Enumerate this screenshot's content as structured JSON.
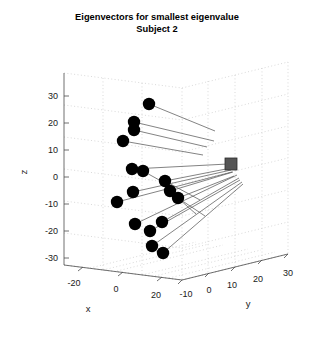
{
  "title": {
    "line1": "Eigenvectors for smallest eigenvalue",
    "line2": "Subject 2"
  },
  "axes": {
    "x": {
      "label": "x",
      "ticks": [
        "-20",
        "0",
        "20"
      ],
      "values": [
        -20,
        0,
        20
      ],
      "range": [
        -30,
        30
      ]
    },
    "y": {
      "label": "y",
      "ticks": [
        "-10",
        "0",
        "10",
        "20",
        "30"
      ],
      "values": [
        -10,
        0,
        10,
        20,
        30
      ],
      "range": [
        -10,
        30
      ]
    },
    "z": {
      "label": "z",
      "ticks": [
        "30",
        "20",
        "10",
        "0",
        "-10",
        "-20",
        "-30"
      ],
      "values": [
        30,
        20,
        10,
        0,
        -10,
        -20,
        -30
      ],
      "range": [
        -30,
        30
      ]
    }
  },
  "colors": {
    "marker": "#000000",
    "center_marker": "#555555",
    "vector_line": "#5a5a5a",
    "grid": "#c8c8c8",
    "axis": "#4d4d4d",
    "background": "#ffffff"
  },
  "chart_data": {
    "type": "scatter",
    "title": "Eigenvectors for smallest eigenvalue Subject 2",
    "xlabel": "x",
    "ylabel": "y",
    "zlabel": "z",
    "xlim": [
      -30,
      30
    ],
    "ylim": [
      -10,
      30
    ],
    "zlim": [
      -30,
      30
    ],
    "grid": true,
    "legend": "none",
    "projection": "3d",
    "center_point": {
      "name": "centroid-marker",
      "px": [
        231,
        164
      ],
      "marker": "square",
      "color": "#555555"
    },
    "series": [
      {
        "name": "landmark-points",
        "marker": "filled-circle",
        "color": "#000000",
        "points_px": [
          [
            149,
            104
          ],
          [
            134,
            122
          ],
          [
            134,
            130
          ],
          [
            123,
            141
          ],
          [
            132,
            169
          ],
          [
            143,
            171
          ],
          [
            165,
            181
          ],
          [
            133,
            192
          ],
          [
            170,
            191
          ],
          [
            178,
            198
          ],
          [
            117,
            202
          ],
          [
            135,
            224
          ],
          [
            162,
            222
          ],
          [
            150,
            231
          ],
          [
            152,
            246
          ],
          [
            163,
            253
          ]
        ]
      }
    ],
    "vectors": [
      {
        "from_px": [
          149,
          104
        ],
        "to_px": [
          215,
          131
        ]
      },
      {
        "from_px": [
          134,
          122
        ],
        "to_px": [
          214,
          141
        ]
      },
      {
        "from_px": [
          134,
          130
        ],
        "to_px": [
          207,
          147
        ]
      },
      {
        "from_px": [
          123,
          141
        ],
        "to_px": [
          203,
          155
        ]
      },
      {
        "from_px": [
          132,
          169
        ],
        "to_px": [
          228,
          164
        ]
      },
      {
        "from_px": [
          143,
          171
        ],
        "to_px": [
          170,
          186
        ]
      },
      {
        "from_px": [
          165,
          181
        ],
        "to_px": [
          231,
          168
        ]
      },
      {
        "from_px": [
          133,
          192
        ],
        "to_px": [
          231,
          170
        ]
      },
      {
        "from_px": [
          170,
          191
        ],
        "to_px": [
          233,
          172
        ]
      },
      {
        "from_px": [
          178,
          198
        ],
        "to_px": [
          234,
          176
        ]
      },
      {
        "from_px": [
          117,
          202
        ],
        "to_px": [
          232,
          172
        ]
      },
      {
        "from_px": [
          135,
          224
        ],
        "to_px": [
          237,
          175
        ]
      },
      {
        "from_px": [
          162,
          222
        ],
        "to_px": [
          239,
          178
        ]
      },
      {
        "from_px": [
          150,
          231
        ],
        "to_px": [
          240,
          180
        ]
      },
      {
        "from_px": [
          152,
          246
        ],
        "to_px": [
          242,
          182
        ]
      },
      {
        "from_px": [
          163,
          253
        ],
        "to_px": [
          243,
          184
        ]
      },
      {
        "from_px": [
          178,
          198
        ],
        "to_px": [
          205,
          216
        ]
      },
      {
        "from_px": [
          170,
          191
        ],
        "to_px": [
          196,
          214
        ]
      },
      {
        "from_px": [
          165,
          181
        ],
        "to_px": [
          200,
          200
        ]
      }
    ]
  }
}
